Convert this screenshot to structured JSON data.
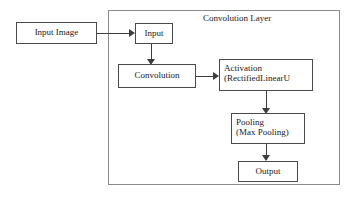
{
  "diagram": {
    "title": "Convolution Layer",
    "nodes": {
      "input_image": {
        "label": "Input Image"
      },
      "input": {
        "label": "Input"
      },
      "convolution": {
        "label": "Convolution"
      },
      "activation": {
        "line1": "Activation",
        "line2": "(RectifiedLinearU"
      },
      "pooling": {
        "line1": "Pooling",
        "line2": "(Max Pooling)"
      },
      "output": {
        "label": "Output"
      }
    },
    "colors": {
      "box_border": "#4a4a4a",
      "container_border": "#8a8a8a",
      "line": "#3d3d3d",
      "text": "#1a1a1a",
      "background": "#ffffff"
    }
  }
}
